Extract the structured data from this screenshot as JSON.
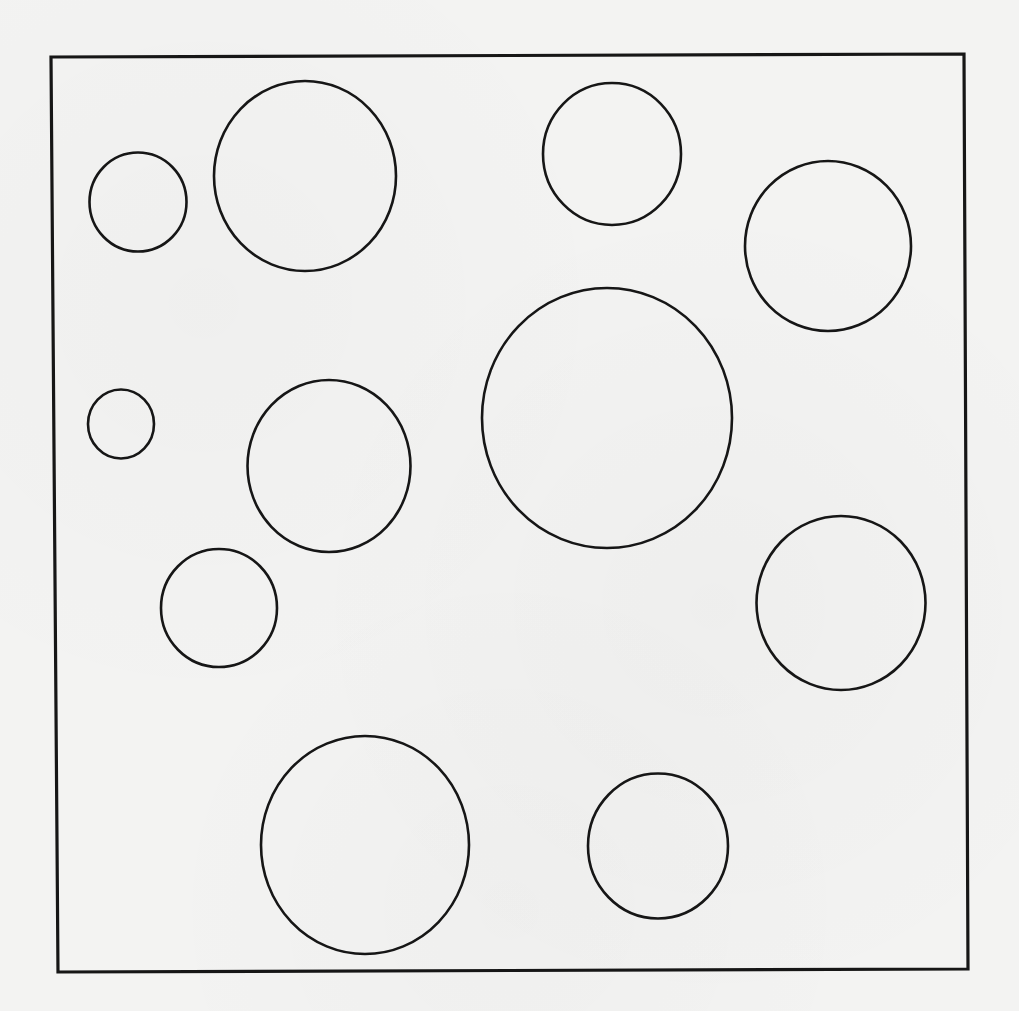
{
  "diagram": {
    "colors": {
      "background": "#f3f3f2",
      "stroke": "#161616",
      "fill": "none"
    },
    "frame": {
      "points": [
        [
          51,
          57
        ],
        [
          964,
          54
        ],
        [
          968,
          969
        ],
        [
          58,
          972
        ]
      ],
      "stroke_width": 3.2
    },
    "circles": [
      {
        "id": "c1",
        "cx": 138,
        "cy": 202,
        "rx": 48.5,
        "ry": 49.5
      },
      {
        "id": "c2",
        "cx": 305,
        "cy": 176,
        "rx": 91,
        "ry": 95
      },
      {
        "id": "c3",
        "cx": 612,
        "cy": 154,
        "rx": 69,
        "ry": 71
      },
      {
        "id": "c4",
        "cx": 828,
        "cy": 246,
        "rx": 83,
        "ry": 85
      },
      {
        "id": "c5",
        "cx": 121,
        "cy": 424,
        "rx": 33,
        "ry": 34.5
      },
      {
        "id": "c6",
        "cx": 329,
        "cy": 466,
        "rx": 81.5,
        "ry": 86
      },
      {
        "id": "c7",
        "cx": 607,
        "cy": 418,
        "rx": 125,
        "ry": 130
      },
      {
        "id": "c8",
        "cx": 219,
        "cy": 608,
        "rx": 58,
        "ry": 59
      },
      {
        "id": "c9",
        "cx": 841,
        "cy": 603,
        "rx": 84.5,
        "ry": 87
      },
      {
        "id": "c10",
        "cx": 365,
        "cy": 845,
        "rx": 104,
        "ry": 109
      },
      {
        "id": "c11",
        "cx": 658,
        "cy": 846,
        "rx": 70,
        "ry": 72.5
      }
    ],
    "circle_stroke_width": 2.6
  }
}
